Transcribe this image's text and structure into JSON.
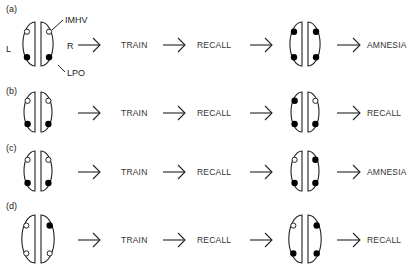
{
  "figure": {
    "anatomy_labels": {
      "left": "L",
      "right": "R",
      "imhv": "IMHV",
      "lpo": "LPO"
    },
    "steps": {
      "train": "TRAIN",
      "recall": "RECALL"
    },
    "rows": [
      {
        "panel": "(a)",
        "before": {
          "left": {
            "top": "open",
            "bottom": "filled"
          },
          "right": {
            "top": "open",
            "bottom": "filled"
          }
        },
        "after": {
          "left": {
            "top": "filled",
            "bottom": "filled"
          },
          "right": {
            "top": "filled",
            "bottom": "filled"
          }
        },
        "outcome": "AMNESIA"
      },
      {
        "panel": "(b)",
        "before": {
          "left": {
            "top": "open",
            "bottom": "filled"
          },
          "right": {
            "top": "open",
            "bottom": "filled"
          }
        },
        "after": {
          "left": {
            "top": "filled",
            "bottom": "filled"
          },
          "right": {
            "top": "open",
            "bottom": "filled"
          }
        },
        "outcome": "RECALL"
      },
      {
        "panel": "(c)",
        "before": {
          "left": {
            "top": "open",
            "bottom": "filled"
          },
          "right": {
            "top": "open",
            "bottom": "filled"
          }
        },
        "after": {
          "left": {
            "top": "open",
            "bottom": "filled"
          },
          "right": {
            "top": "filled",
            "bottom": "filled"
          }
        },
        "outcome": "AMNESIA"
      },
      {
        "panel": "(d)",
        "before": {
          "left": {
            "top": "open",
            "bottom": "open"
          },
          "right": {
            "top": "filled",
            "bottom": "open"
          }
        },
        "after": {
          "left": {
            "top": "open",
            "bottom": "filled"
          },
          "right": {
            "top": "filled",
            "bottom": "filled"
          }
        },
        "outcome": "RECALL"
      }
    ]
  }
}
